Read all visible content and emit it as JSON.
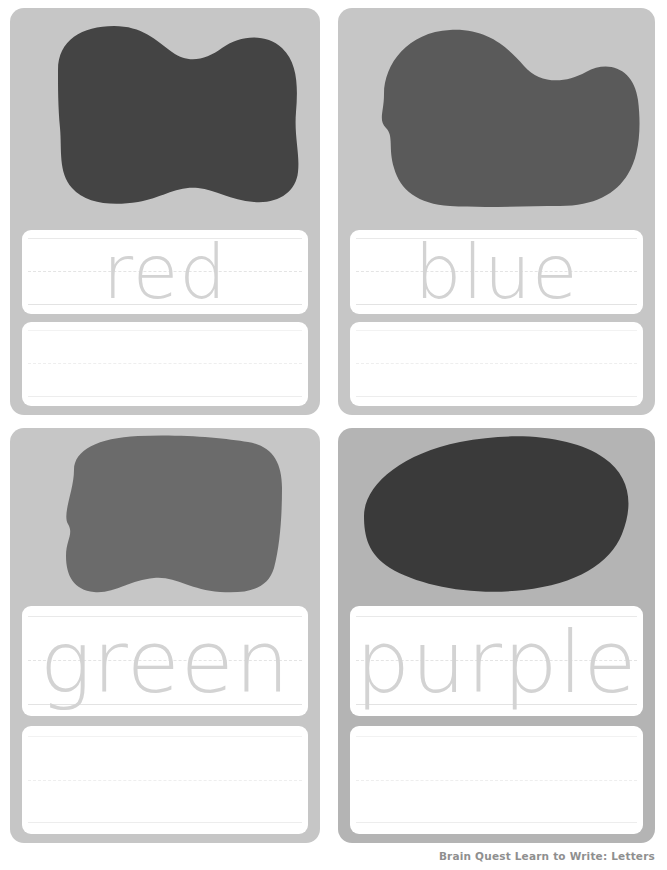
{
  "page": {
    "background_color": "#ffffff",
    "footer_credit": "Brain Quest Learn to Write: Letters"
  },
  "cards": [
    {
      "id": "card-red",
      "word": "red",
      "blob_name": "color-blob-red",
      "blob_color": "#444444",
      "card_color": "#c6c6c6",
      "trace_line_label": "red",
      "blank_line_label": ""
    },
    {
      "id": "card-blue",
      "word": "blue",
      "blob_name": "color-blob-blue",
      "blob_color": "#5a5a5a",
      "card_color": "#c6c6c6",
      "trace_line_label": "blue",
      "blank_line_label": ""
    },
    {
      "id": "card-green",
      "word": "green",
      "blob_name": "color-blob-green",
      "blob_color": "#6b6b6b",
      "card_color": "#c6c6c6",
      "trace_line_label": "green",
      "blank_line_label": ""
    },
    {
      "id": "card-purple",
      "word": "purple",
      "blob_name": "color-blob-purple",
      "blob_color": "#3a3a3a",
      "card_color": "#b4b4b4",
      "trace_line_label": "purple",
      "blank_line_label": ""
    }
  ]
}
